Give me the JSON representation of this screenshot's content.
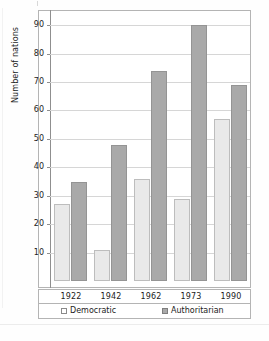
{
  "chart_data": {
    "type": "bar",
    "title": "",
    "xlabel": "",
    "ylabel": "Number of nations",
    "categories": [
      "1922",
      "1942",
      "1962",
      "1973",
      "1990"
    ],
    "series": [
      {
        "name": "Democratic",
        "color": "#e9e9e9",
        "values": [
          27,
          11,
          36,
          29,
          57
        ]
      },
      {
        "name": "Authoritarian",
        "color": "#a9a9a9",
        "values": [
          35,
          48,
          74,
          90,
          69
        ]
      }
    ],
    "ylim": [
      0,
      95
    ],
    "yticks": [
      10,
      20,
      30,
      40,
      50,
      60,
      70,
      80,
      90
    ],
    "ytick_labels": [
      "10",
      "20",
      "30",
      "40",
      "50",
      "60",
      "70",
      "80",
      "90"
    ],
    "grid": true,
    "legend_position": "bottom",
    "legend": [
      {
        "label": "Democratic",
        "swatch": "light-gray-outline-square"
      },
      {
        "label": "Authoritarian",
        "swatch": "dark-gray-filled-square"
      }
    ]
  }
}
